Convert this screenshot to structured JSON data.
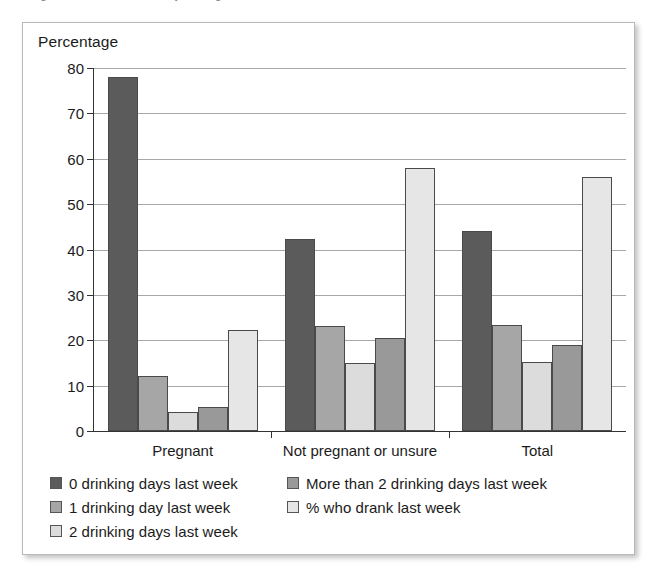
{
  "page": {
    "clipped_header_text": "ollege of Obstetricians and Gynecologists"
  },
  "figure": {
    "title": "Percentage"
  },
  "legend": {
    "position": "bottom-left",
    "column_1": [
      {
        "label": "0 drinking days last week",
        "color": "#5b5b5b"
      },
      {
        "label": "1 drinking day last week",
        "color": "#a6a6a6"
      },
      {
        "label": "2 drinking days last week",
        "color": "#dcdcdc"
      }
    ],
    "column_2": [
      {
        "label": "More than 2 drinking days last week",
        "color": "#999999"
      },
      {
        "label": "% who drank last week",
        "color": "#e6e6e6"
      }
    ]
  },
  "chart_data": {
    "type": "bar",
    "title": "Percentage",
    "xlabel": "",
    "ylabel": "Percentage",
    "ylim": [
      0,
      80
    ],
    "yticks": [
      0,
      10,
      20,
      30,
      40,
      50,
      60,
      70,
      80
    ],
    "ytick_labels": [
      "0",
      "10",
      "20",
      "30",
      "40",
      "50",
      "60",
      "70",
      "80"
    ],
    "grid": true,
    "grid_axis": "y",
    "categories": [
      "Pregnant",
      "Not pregnant or unsure",
      "Total"
    ],
    "series": [
      {
        "name": "0 drinking days last week",
        "color": "#5b5b5b",
        "values": [
          78,
          42.3,
          44
        ]
      },
      {
        "name": "1 drinking day last week",
        "color": "#a6a6a6",
        "values": [
          12.1,
          23.2,
          23.3
        ]
      },
      {
        "name": "2 drinking days last week",
        "color": "#dcdcdc",
        "values": [
          4.1,
          15,
          15.1
        ]
      },
      {
        "name": "More than 2 drinking days last week",
        "color": "#999999",
        "values": [
          5.3,
          20.5,
          19
        ]
      },
      {
        "name": "% who drank last week",
        "color": "#e6e6e6",
        "values": [
          22.2,
          58,
          56
        ]
      }
    ]
  }
}
